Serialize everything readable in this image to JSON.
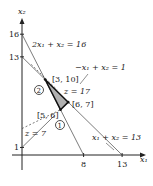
{
  "diagram": {
    "axes": {
      "x_label": "x₁",
      "y_label": "x₂",
      "x_ticks": [
        {
          "value": 8,
          "label": "8"
        },
        {
          "value": 13,
          "label": "13"
        }
      ],
      "y_ticks": [
        {
          "value": 1,
          "label": "1"
        },
        {
          "value": 13,
          "label": "13"
        },
        {
          "value": 16,
          "label": "16"
        }
      ]
    },
    "constraints": [
      {
        "label": "2x₁ + x₂ = 16",
        "from": [
          0,
          16
        ],
        "to": [
          8,
          0
        ]
      },
      {
        "label": "x₁ + x₂ = 13",
        "from": [
          0,
          13
        ],
        "to": [
          13,
          0
        ]
      },
      {
        "label": "−x₁ + x₂ = 1",
        "from": [
          0,
          1
        ],
        "to": [
          4.2,
          5.2
        ]
      }
    ],
    "objective_lines": [
      {
        "label": "z = 17"
      },
      {
        "label": "z = 7"
      }
    ],
    "feasible_region": {
      "vertices": [
        [
          3,
          10
        ],
        [
          6,
          7
        ],
        [
          5,
          6
        ]
      ],
      "fill": "#b0b0b0"
    },
    "points": [
      {
        "label": "[3, 10]",
        "coord": [
          3,
          10
        ]
      },
      {
        "label": "[6, 7]",
        "coord": [
          6,
          7
        ]
      },
      {
        "label": "[5, 6]",
        "coord": [
          5,
          6
        ]
      }
    ],
    "circled_markers": [
      {
        "label": "2",
        "near": [
          3,
          10
        ]
      },
      {
        "label": "1",
        "near": [
          5,
          6
        ]
      }
    ]
  }
}
